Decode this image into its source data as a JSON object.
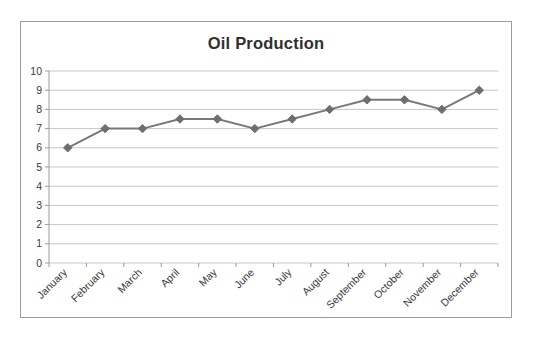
{
  "chart_data": {
    "type": "line",
    "title": "Oil Production",
    "xlabel": "",
    "ylabel": "",
    "categories": [
      "January",
      "February",
      "March",
      "April",
      "May",
      "June",
      "July",
      "August",
      "September",
      "October",
      "November",
      "December"
    ],
    "values": [
      6,
      7,
      7,
      7.5,
      7.5,
      7,
      7.5,
      8,
      8.5,
      8.5,
      8,
      9
    ],
    "series": [
      {
        "name": "Oil Production",
        "values": [
          6,
          7,
          7,
          7.5,
          7.5,
          7,
          7.5,
          8,
          8.5,
          8.5,
          8,
          9
        ]
      }
    ],
    "ylim": [
      0,
      10
    ],
    "ytick_labels": [
      "0",
      "1",
      "2",
      "3",
      "4",
      "5",
      "6",
      "7",
      "8",
      "9",
      "10"
    ],
    "ytick_values": [
      0,
      1,
      2,
      3,
      4,
      5,
      6,
      7,
      8,
      9,
      10
    ],
    "grid": true,
    "grid_axis": "y",
    "legend": false,
    "legend_position": "none",
    "marker": "diamond",
    "line_color": "#787878",
    "marker_color": "#6e6e6e",
    "grid_color": "#b7b7b7",
    "title_color": "#2f2f2f",
    "border_color": "#9b9b9b",
    "background_color": "#ffffff",
    "xtick_label_rotation": -45
  }
}
